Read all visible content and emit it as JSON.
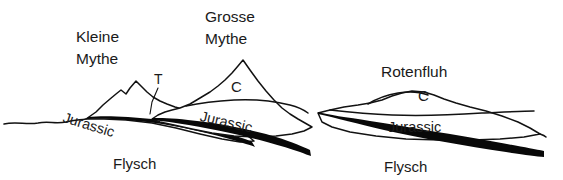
{
  "figure": {
    "type": "geological-cross-section",
    "background_color": "#ffffff",
    "line_color": "#121212"
  },
  "peaks": {
    "kleine_mythe_line1": "Kleine",
    "kleine_mythe_line2": "Mythe",
    "grosse_mythe_line1": "Grosse",
    "grosse_mythe_line2": "Mythe",
    "rotenfluh": "Rotenfluh"
  },
  "thrust": {
    "label": "T"
  },
  "units": {
    "cretaceous_code_grosse": "C",
    "cretaceous_code_rotenfluh": "C",
    "jurassic_kleine": "Jurassic",
    "jurassic_grosse": "Jurassic",
    "jurassic_rotenfluh": "Jurassic",
    "flysch_left": "Flysch",
    "flysch_right": "Flysch"
  }
}
